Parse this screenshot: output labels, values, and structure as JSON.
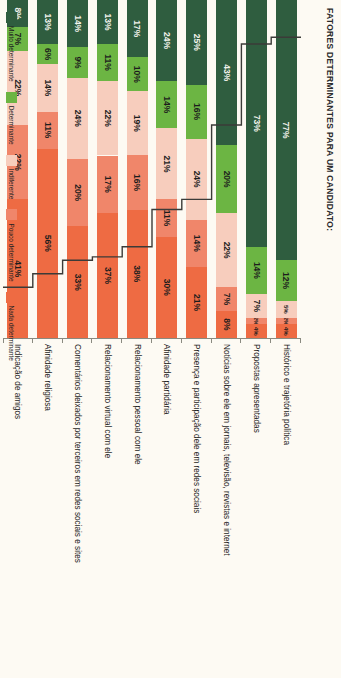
{
  "chart_data": {
    "type": "bar",
    "orientation": "stacked-horizontal-rotated",
    "title": "FATORES DETERMINANTES PARA UM CANDIDATO:",
    "categories": [
      "Histórico e trajetória política",
      "Propostas apresentadas",
      "Notícias sobre ele em jornais, televisão, revistas e internet",
      "Presença e participação dele em redes sociais",
      "Afinidade partidária",
      "Relacionamento pessoal com ele",
      "Relacionamento virtual com ele",
      "Comentários deixados por terceiros em redes sociais e sites",
      "Afinidade religiosa",
      "Indicação de amigos"
    ],
    "series": [
      {
        "name": "Nada determinante",
        "color": "#ee6b43",
        "values": [
          4,
          4,
          8,
          21,
          30,
          38,
          37,
          33,
          56,
          41
        ]
      },
      {
        "name": "Pouco determinante",
        "color": "#f0866a",
        "values": [
          2,
          2,
          7,
          14,
          11,
          16,
          17,
          20,
          11,
          22
        ]
      },
      {
        "name": "Indiferente",
        "color": "#f7cdbd",
        "values": [
          5,
          7,
          22,
          24,
          21,
          19,
          22,
          24,
          14,
          22
        ]
      },
      {
        "name": "Determinante",
        "color": "#6cb543",
        "values": [
          12,
          14,
          20,
          16,
          14,
          10,
          11,
          9,
          6,
          7
        ]
      },
      {
        "name": "Muito determinante",
        "color": "#2f5d3f",
        "values": [
          77,
          73,
          43,
          25,
          24,
          17,
          13,
          14,
          13,
          8
        ]
      }
    ],
    "value_suffix": "%",
    "xlim": [
      0,
      100
    ],
    "grid": false,
    "legend_position": "bottom",
    "step_line": {
      "present": true,
      "color": "#3b3b38",
      "description": "Stepped line separating determinante/indiferente boundary across categories"
    },
    "axis": {
      "tick_count": 11,
      "tick_labels": []
    }
  },
  "legend": {
    "items": [
      {
        "label": "Muito determinante",
        "color": "#2f5d3f"
      },
      {
        "label": "Determinante",
        "color": "#6cb543"
      },
      {
        "label": "Indiferente",
        "color": "#f7cdbd"
      },
      {
        "label": "Pouco determinante",
        "color": "#f0866a"
      },
      {
        "label": "Nada determinante",
        "color": "#ee6b43"
      }
    ]
  }
}
